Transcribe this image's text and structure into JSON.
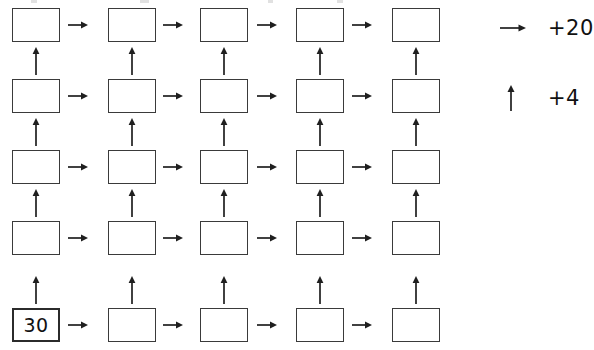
{
  "worksheet": {
    "title": "Arrow chain number grid",
    "grid": {
      "rows": 5,
      "columns": 5,
      "cells": [
        [
          {
            "value": "",
            "filled": false
          },
          {
            "value": "",
            "filled": false
          },
          {
            "value": "",
            "filled": false
          },
          {
            "value": "",
            "filled": false
          },
          {
            "value": "",
            "filled": false
          }
        ],
        [
          {
            "value": "",
            "filled": false
          },
          {
            "value": "",
            "filled": false
          },
          {
            "value": "",
            "filled": false
          },
          {
            "value": "",
            "filled": false
          },
          {
            "value": "",
            "filled": false
          }
        ],
        [
          {
            "value": "",
            "filled": false
          },
          {
            "value": "",
            "filled": false
          },
          {
            "value": "",
            "filled": false
          },
          {
            "value": "",
            "filled": false
          },
          {
            "value": "",
            "filled": false
          }
        ],
        [
          {
            "value": "",
            "filled": false
          },
          {
            "value": "",
            "filled": false
          },
          {
            "value": "",
            "filled": false
          },
          {
            "value": "",
            "filled": false
          },
          {
            "value": "",
            "filled": false
          }
        ],
        [
          {
            "value": "30",
            "filled": true
          },
          {
            "value": "",
            "filled": false
          },
          {
            "value": "",
            "filled": false
          },
          {
            "value": "",
            "filled": false
          },
          {
            "value": "",
            "filled": false
          }
        ]
      ]
    },
    "legend": {
      "items": [
        {
          "icon": "arrow-right-icon",
          "direction": "right",
          "label": "+20"
        },
        {
          "icon": "arrow-up-icon",
          "direction": "up",
          "label": "+4"
        }
      ]
    },
    "colors": {
      "box_border": "#3a3a3a",
      "filled_box_border": "#2b2b2b",
      "arrow": "#1f1f1f",
      "text": "#111111",
      "background": "#ffffff"
    }
  }
}
